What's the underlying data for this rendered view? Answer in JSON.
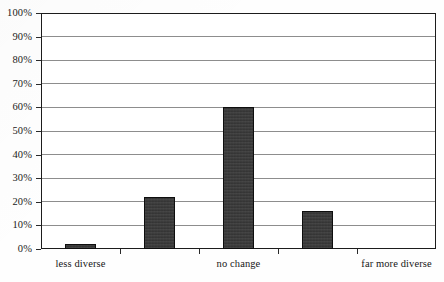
{
  "chart_data": {
    "type": "bar",
    "title": "",
    "xlabel": "",
    "ylabel": "",
    "categories": [
      "less diverse",
      "",
      "no change",
      "",
      "far more diverse"
    ],
    "values": [
      2,
      22,
      60,
      16,
      0
    ],
    "ylim": [
      0,
      100
    ],
    "y_ticks": [
      "0%",
      "10%",
      "20%",
      "30%",
      "40%",
      "50%",
      "60%",
      "70%",
      "80%",
      "90%",
      "100%"
    ],
    "y_tick_values": [
      0,
      10,
      20,
      30,
      40,
      50,
      60,
      70,
      80,
      90,
      100
    ],
    "grid": true,
    "legend": false,
    "bar_color": "#353535",
    "bar_edge_color": "#0e0e0e",
    "gridline_color": "#8d8d8d",
    "axis_color": "#1c1c1c",
    "visible_x_labels": [
      "less diverse",
      "no change",
      "far more diverse"
    ]
  }
}
